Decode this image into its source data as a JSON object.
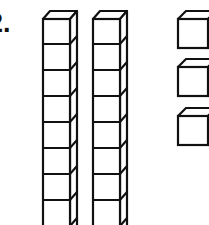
{
  "problem": {
    "label": "2."
  },
  "base_ten_blocks": {
    "rods": {
      "count": 2,
      "label": "tens rods",
      "visible_units_per_rod": 8
    },
    "unit_cubes": {
      "count": 3,
      "label": "ones cubes"
    }
  },
  "colors": {
    "stroke": "#111111",
    "fill": "#ffffff",
    "background": "#ffffff"
  }
}
